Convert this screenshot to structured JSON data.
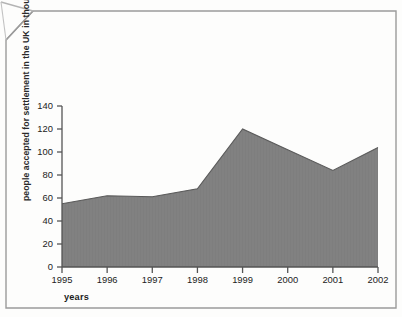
{
  "page": {
    "background_color": "#fdfdfc",
    "border_color": "#9a9a9a",
    "corner_fold": "folded-corner-top-left"
  },
  "chart_data": {
    "type": "area",
    "title": "",
    "subtitle": "",
    "xlabel": "years",
    "ylabel": "people accepted for settlement in the UK in thousands",
    "categories": [
      "1995",
      "1996",
      "1997",
      "1998",
      "1999",
      "2000",
      "2001",
      "2002"
    ],
    "values": [
      55,
      62,
      61,
      68,
      120,
      102,
      84,
      104
    ],
    "series": [
      {
        "name": "people accepted for settlement in the UK",
        "values": [
          55,
          62,
          61,
          68,
          120,
          102,
          84,
          104
        ]
      }
    ],
    "ylim": [
      0,
      140
    ],
    "yticks": [
      0,
      20,
      40,
      60,
      80,
      100,
      120,
      140
    ],
    "ytick_labels": [
      "0",
      "20",
      "40",
      "60",
      "80",
      "100",
      "120",
      "140"
    ],
    "xticks": [
      "1995",
      "1996",
      "1997",
      "1998",
      "1999",
      "2000",
      "2001",
      "2002"
    ],
    "grid": false,
    "legend": false,
    "legend_position": "none",
    "area_fill_color": "#7e7e7e",
    "line_color": "#4a4a4a",
    "axis_color": "#555555",
    "text_color": "#222222"
  },
  "axis": {
    "y_title": "people accepted for settlement in the UK in thousands",
    "x_title": "years",
    "y_labels": [
      "140",
      "120",
      "100",
      "80",
      "60",
      "40",
      "20",
      "0"
    ],
    "x_labels": [
      "1995",
      "1996",
      "1997",
      "1998",
      "1999",
      "2000",
      "2001",
      "2002"
    ]
  }
}
